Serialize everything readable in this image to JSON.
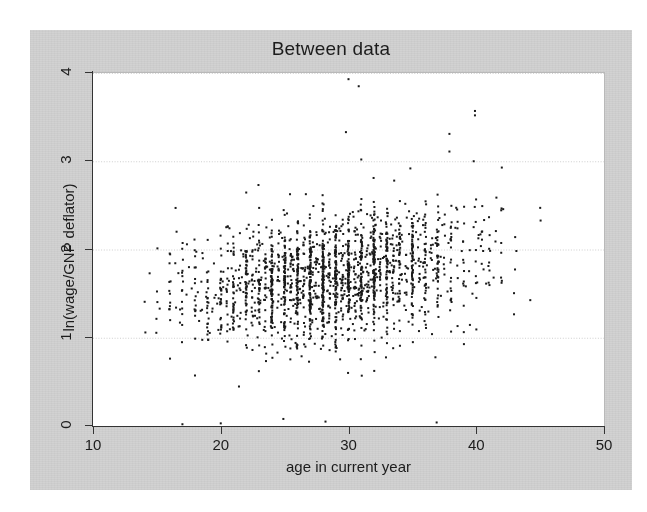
{
  "figure": {
    "background_color": "#ffffff",
    "panel_color": "#d2d2d2",
    "plot_background_color": "#ffffff",
    "marker_color": "#1a1a1a",
    "gridline_color": "#c8c8c8",
    "axis_color": "#343434"
  },
  "chart_data": {
    "type": "scatter",
    "title": "Between data",
    "xlabel": "age in current year",
    "ylabel": "ln(wage/GNP deflator)",
    "xlim": [
      10,
      50
    ],
    "ylim": [
      0,
      4
    ],
    "xticks": [
      10,
      20,
      30,
      40,
      50
    ],
    "yticks": [
      0,
      1,
      2,
      3,
      4
    ],
    "xtick_labels": [
      "10",
      "20",
      "30",
      "40",
      "50"
    ],
    "ytick_labels": [
      "0",
      "1",
      "2",
      "3",
      "4"
    ],
    "grid": "horizontal",
    "grid_style": "dotted",
    "legend": "none",
    "marker": "square",
    "marker_size_px": 2,
    "n_points": 2178,
    "x_data_range": [
      14.0,
      45.6
    ],
    "y_data_range": [
      0.0,
      3.93
    ],
    "distribution": {
      "x_mean": 28.6,
      "x_sd": 5.4,
      "y_mean": 1.72,
      "y_sd": 0.36,
      "correlation": 0.33,
      "integer_age_striping": true
    },
    "notable_outliers": [
      {
        "x": 30.0,
        "y": 3.93
      },
      {
        "x": 30.8,
        "y": 3.85
      },
      {
        "x": 39.9,
        "y": 3.57
      },
      {
        "x": 39.9,
        "y": 3.52
      },
      {
        "x": 29.8,
        "y": 3.33
      },
      {
        "x": 37.9,
        "y": 3.31
      },
      {
        "x": 37.9,
        "y": 3.11
      },
      {
        "x": 31.0,
        "y": 3.02
      },
      {
        "x": 39.8,
        "y": 3.0
      },
      {
        "x": 24.9,
        "y": 0.08
      },
      {
        "x": 28.2,
        "y": 0.05
      },
      {
        "x": 17.0,
        "y": 0.02
      },
      {
        "x": 20.0,
        "y": 0.03
      },
      {
        "x": 36.9,
        "y": 0.04
      },
      {
        "x": 14.1,
        "y": 1.06
      }
    ]
  }
}
